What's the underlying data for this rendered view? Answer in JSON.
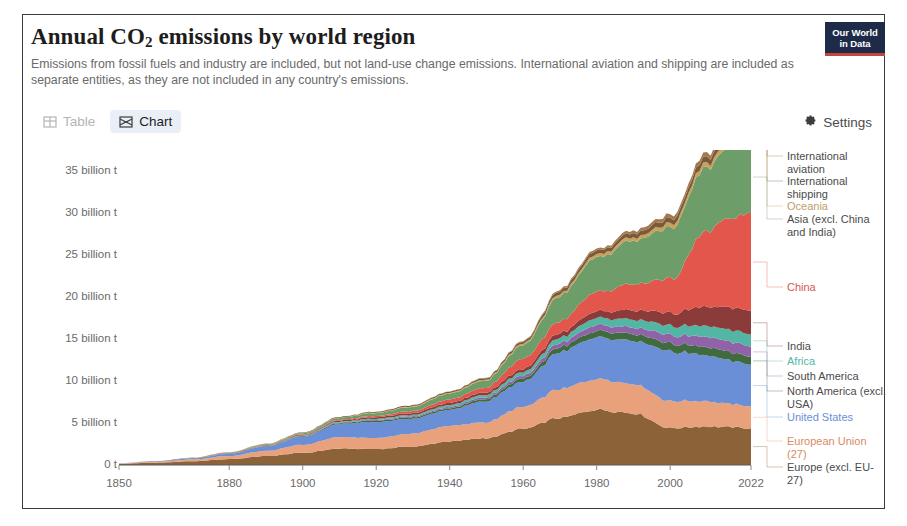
{
  "header": {
    "title_main": "Annual CO",
    "title_sub": "2",
    "title_rest": " emissions by world region",
    "subtitle": "Emissions from fossil fuels and industry are included, but not land-use change emissions. International aviation and shipping are included as separate entities, as they are not included in any country's emissions.",
    "logo_line1": "Our World",
    "logo_line2": "in Data"
  },
  "toolbar": {
    "tab_table": "Table",
    "tab_chart": "Chart",
    "settings": "Settings",
    "table_icon": "table-grid-icon",
    "chart_icon": "stacked-area-icon",
    "settings_icon": "gear-icon"
  },
  "chart_data": {
    "type": "area",
    "xlabel": "",
    "ylabel": "",
    "grid": false,
    "legend_position": "right",
    "xlim": [
      1850,
      2022
    ],
    "ylim": [
      0,
      37
    ],
    "unit": "billion t",
    "xticks": [
      1850,
      1880,
      1900,
      1920,
      1940,
      1960,
      1980,
      2000,
      2022
    ],
    "xtick_labels": [
      "1850",
      "1880",
      "1900",
      "1920",
      "1940",
      "1960",
      "1980",
      "2000",
      "2022"
    ],
    "yticks": [
      0,
      5,
      10,
      15,
      20,
      25,
      30,
      35
    ],
    "ytick_labels": [
      "0 t",
      "5 billion t",
      "10 billion t",
      "15 billion t",
      "20 billion t",
      "25 billion t",
      "30 billion t",
      "35 billion t"
    ],
    "x": [
      1850,
      1860,
      1870,
      1880,
      1890,
      1900,
      1910,
      1920,
      1930,
      1940,
      1950,
      1960,
      1970,
      1980,
      1990,
      2000,
      2010,
      2015,
      2022
    ],
    "series": [
      {
        "name": "Europe (excl. EU-27)",
        "color": "#8c6239",
        "label_color": "#4b4b4b",
        "values": [
          0.15,
          0.28,
          0.45,
          0.7,
          1.05,
          1.45,
          1.95,
          1.9,
          2.2,
          2.8,
          3.2,
          4.3,
          5.6,
          6.6,
          6.2,
          4.4,
          4.6,
          4.5,
          4.4
        ]
      },
      {
        "name": "European Union (27)",
        "color": "#e9a17c",
        "label_color": "#d98b63",
        "values": [
          0.04,
          0.1,
          0.2,
          0.38,
          0.62,
          0.95,
          1.35,
          1.3,
          1.55,
          1.85,
          1.9,
          2.6,
          3.4,
          3.7,
          3.5,
          3.2,
          3.0,
          2.8,
          2.6
        ]
      },
      {
        "name": "United States",
        "color": "#6a8fd6",
        "label_color": "#6a8fd6",
        "values": [
          0.02,
          0.06,
          0.12,
          0.26,
          0.55,
          0.95,
          1.55,
          1.9,
          1.75,
          1.9,
          2.55,
          3.0,
          4.4,
          4.9,
          5.1,
          5.9,
          5.5,
          5.2,
          5.0
        ]
      },
      {
        "name": "North America (excl. USA)",
        "color": "#3f6b3f",
        "label_color": "#4b4b4b",
        "values": [
          0.0,
          0.0,
          0.01,
          0.02,
          0.04,
          0.07,
          0.12,
          0.16,
          0.18,
          0.2,
          0.28,
          0.38,
          0.6,
          0.75,
          0.82,
          0.93,
          1.0,
          1.0,
          0.95
        ]
      },
      {
        "name": "South America",
        "color": "#9063a8",
        "label_color": "#4b4b4b",
        "values": [
          0.0,
          0.0,
          0.01,
          0.01,
          0.02,
          0.04,
          0.07,
          0.1,
          0.12,
          0.15,
          0.22,
          0.33,
          0.5,
          0.72,
          0.78,
          1.0,
          1.2,
          1.25,
          1.2
        ]
      },
      {
        "name": "Africa",
        "color": "#53b5a4",
        "label_color": "#53b5a4",
        "values": [
          0.0,
          0.0,
          0.01,
          0.02,
          0.03,
          0.06,
          0.1,
          0.14,
          0.18,
          0.22,
          0.28,
          0.42,
          0.62,
          0.85,
          0.95,
          1.1,
          1.3,
          1.4,
          1.45
        ]
      },
      {
        "name": "India",
        "color": "#8c3b3b",
        "label_color": "#4b4b4b",
        "values": [
          0.0,
          0.01,
          0.02,
          0.03,
          0.05,
          0.08,
          0.12,
          0.18,
          0.22,
          0.26,
          0.3,
          0.4,
          0.55,
          0.8,
          1.1,
          1.5,
          2.3,
          2.6,
          2.8
        ]
      },
      {
        "name": "China",
        "color": "#e2564c",
        "label_color": "#d6594f",
        "values": [
          0.0,
          0.01,
          0.02,
          0.03,
          0.04,
          0.06,
          0.1,
          0.15,
          0.25,
          0.4,
          0.55,
          1.2,
          1.4,
          2.3,
          3.1,
          4.0,
          9.0,
          10.3,
          11.4
        ]
      },
      {
        "name": "Asia (excl. China and India)",
        "color": "#6d9e6a",
        "label_color": "#4b4b4b",
        "values": [
          0.0,
          0.01,
          0.02,
          0.04,
          0.07,
          0.13,
          0.22,
          0.35,
          0.5,
          0.7,
          0.85,
          1.6,
          3.0,
          4.1,
          5.2,
          6.1,
          7.6,
          8.2,
          8.6
        ]
      },
      {
        "name": "Oceania",
        "color": "#c9a05c",
        "label_color": "#c0a06a",
        "values": [
          0.0,
          0.0,
          0.0,
          0.01,
          0.02,
          0.03,
          0.04,
          0.06,
          0.07,
          0.09,
          0.12,
          0.17,
          0.25,
          0.33,
          0.38,
          0.45,
          0.52,
          0.52,
          0.5
        ]
      },
      {
        "name": "International shipping",
        "color": "#7b5a3a",
        "label_color": "#4b4b4b",
        "values": [
          0.0,
          0.0,
          0.01,
          0.02,
          0.03,
          0.05,
          0.08,
          0.1,
          0.12,
          0.14,
          0.18,
          0.25,
          0.38,
          0.45,
          0.5,
          0.62,
          0.7,
          0.68,
          0.65
        ]
      },
      {
        "name": "International aviation",
        "color": "#a3794f",
        "label_color": "#4b4b4b",
        "values": [
          0.0,
          0.0,
          0.0,
          0.0,
          0.0,
          0.0,
          0.0,
          0.01,
          0.02,
          0.03,
          0.05,
          0.09,
          0.17,
          0.22,
          0.32,
          0.42,
          0.5,
          0.56,
          0.45
        ]
      }
    ]
  },
  "legend": [
    {
      "label": "International aviation",
      "color": "#4b4b4b",
      "top": 0
    },
    {
      "label": "International shipping",
      "color": "#4b4b4b",
      "top": 25
    },
    {
      "label": "Oceania",
      "color": "#c0a06a",
      "top": 50
    },
    {
      "label": "Asia (excl. China and India)",
      "color": "#4b4b4b",
      "top": 63
    },
    {
      "label": "China",
      "color": "#d6594f",
      "top": 131
    },
    {
      "label": "India",
      "color": "#4b4b4b",
      "top": 190
    },
    {
      "label": "Africa",
      "color": "#53b5a4",
      "top": 205
    },
    {
      "label": "South America",
      "color": "#4b4b4b",
      "top": 220
    },
    {
      "label": "North America (excl. USA)",
      "color": "#4b4b4b",
      "top": 235
    },
    {
      "label": "United States",
      "color": "#6a8fd6",
      "top": 261
    },
    {
      "label": "European Union (27)",
      "color": "#d98b63",
      "top": 285
    },
    {
      "label": "Europe (excl. EU-27)",
      "color": "#4b4b4b",
      "top": 311
    }
  ]
}
